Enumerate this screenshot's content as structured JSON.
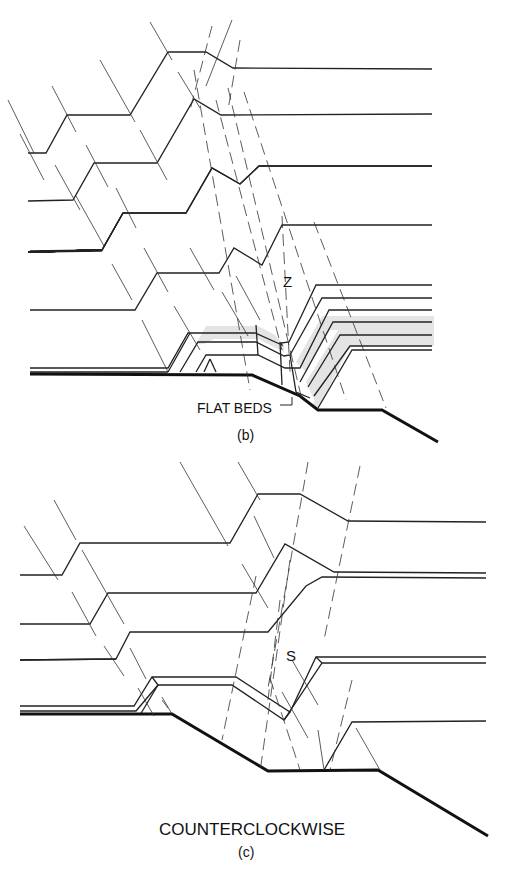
{
  "panel_b": {
    "fold_label": "Z",
    "annotation": "FLAT BEDS",
    "caption": "(b)"
  },
  "panel_c": {
    "fold_label": "S",
    "title": "COUNTERCLOCKWISE",
    "caption": "(c)"
  },
  "colors": {
    "line": "#222222",
    "shade": "#e4e4e4",
    "background": "#ffffff"
  }
}
